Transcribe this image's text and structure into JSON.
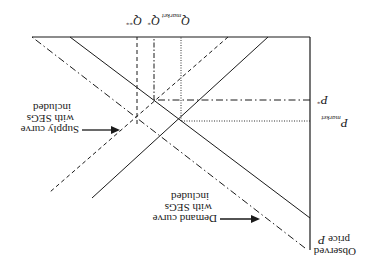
{
  "diagram": {
    "orientation": "rotated-180",
    "axes": {
      "y_axis_label_line1": "Observed",
      "y_axis_label_line2": "price ",
      "y_axis_label_var": "P"
    },
    "quantity_labels": {
      "q_star_star": "Q",
      "q_star_star_sup": "**",
      "q_star": "Q",
      "q_star_sup": "*",
      "q_market": "Q",
      "q_market_sub": "market"
    },
    "price_labels": {
      "p_star": "P",
      "p_star_sup": "*",
      "p_market": "P",
      "p_market_sub": "market"
    },
    "annotations": {
      "demand_line1": "Demand curve",
      "demand_line2": "with SEGs",
      "demand_line3": "included",
      "supply_line1": "Supply curve",
      "supply_line2": "with SEGs",
      "supply_line3": "included"
    },
    "curves": [
      {
        "name": "Demand curve",
        "style": "solid"
      },
      {
        "name": "Demand curve with SEGs included",
        "style": "dash-dot"
      },
      {
        "name": "Supply curve",
        "style": "solid"
      },
      {
        "name": "Supply curve with SEGs included",
        "style": "dashed"
      }
    ],
    "colors": {
      "line": "#1a1a1a",
      "background": "#ffffff"
    }
  }
}
